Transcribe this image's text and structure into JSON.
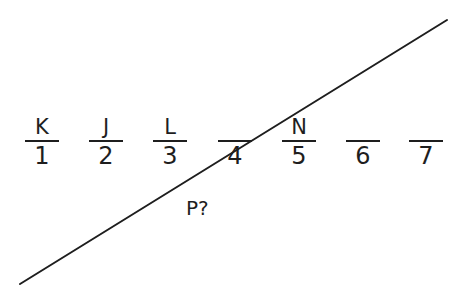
{
  "diagram": {
    "type": "ordering-puzzle",
    "slots": [
      {
        "position": "1",
        "letter": "K"
      },
      {
        "position": "2",
        "letter": "J"
      },
      {
        "position": "3",
        "letter": "L"
      },
      {
        "position": "4",
        "letter": ""
      },
      {
        "position": "5",
        "letter": "N"
      },
      {
        "position": "6",
        "letter": ""
      },
      {
        "position": "7",
        "letter": ""
      }
    ],
    "question_label": "P?",
    "divider_line": {
      "from": [
        20,
        284
      ],
      "to": [
        447,
        20
      ],
      "color": "#1e1e1e"
    }
  }
}
